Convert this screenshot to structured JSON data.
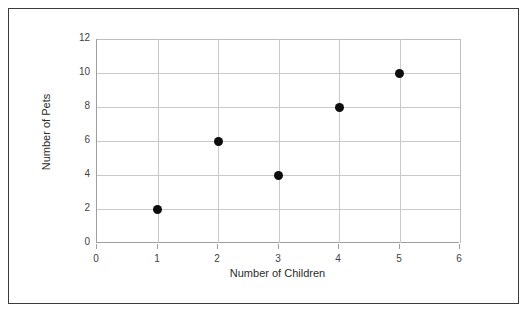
{
  "figure": {
    "background_color": "#ffffff",
    "border_color": "#3b3b3b",
    "marker_color": "#0d0d0d",
    "gridline_color": "#c9c9c9",
    "axis_color": "#9e9e9e"
  },
  "chart_data": {
    "type": "scatter",
    "title": "",
    "xlabel": "Number of Children",
    "ylabel": "Number of Pets",
    "xlim": [
      0,
      6
    ],
    "ylim": [
      0,
      12
    ],
    "xticks": [
      0,
      1,
      2,
      3,
      4,
      5,
      6
    ],
    "yticks": [
      0,
      2,
      4,
      6,
      8,
      10,
      12
    ],
    "xtick_labels": [
      "0",
      "1",
      "2",
      "3",
      "4",
      "5",
      "6"
    ],
    "ytick_labels": [
      "0",
      "2",
      "4",
      "6",
      "8",
      "10",
      "12"
    ],
    "grid": true,
    "grid_axes": "both",
    "legend": false,
    "legend_position": "none",
    "series": [
      {
        "name": "Pets per family",
        "marker": "filled-circle",
        "color": "#0d0d0d",
        "points": [
          {
            "x": 1,
            "y": 2
          },
          {
            "x": 2,
            "y": 6
          },
          {
            "x": 3,
            "y": 4
          },
          {
            "x": 4,
            "y": 8
          },
          {
            "x": 5,
            "y": 10
          }
        ]
      }
    ],
    "x": [
      1,
      2,
      3,
      4,
      5
    ],
    "values": [
      2,
      6,
      4,
      8,
      10
    ]
  }
}
